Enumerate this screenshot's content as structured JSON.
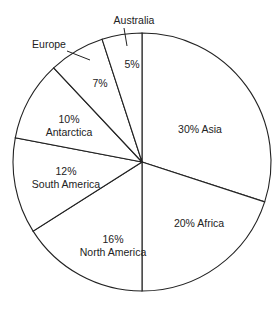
{
  "chart_data": {
    "type": "pie",
    "title": "",
    "start": "top",
    "direction": "clockwise",
    "slices": [
      {
        "label": "Asia",
        "value": 30,
        "text_lines": [
          "30% Asia"
        ]
      },
      {
        "label": "Africa",
        "value": 20,
        "text_lines": [
          "20% Africa"
        ]
      },
      {
        "label": "North America",
        "value": 16,
        "text_lines": [
          "16%",
          "North America"
        ]
      },
      {
        "label": "South America",
        "value": 12,
        "text_lines": [
          "12%",
          "South America"
        ]
      },
      {
        "label": "Antarctica",
        "value": 10,
        "text_lines": [
          "10%",
          "Antarctica"
        ]
      },
      {
        "label": "Europe",
        "value": 7,
        "text_lines": [
          "7%"
        ],
        "callout": "Europe"
      },
      {
        "label": "Australia",
        "value": 5,
        "text_lines": [
          "5%"
        ],
        "callout": "Australia"
      }
    ],
    "stroke_color": "#222222",
    "fill_color": "#ffffff"
  }
}
